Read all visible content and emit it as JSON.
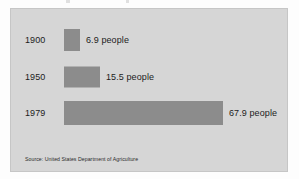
{
  "figure": {
    "panel_background": "#d6d6d6",
    "bar_color": "#8c8c8c",
    "text_color": "#1c1c1c"
  },
  "source_note": "Source: United States Department of Agriculture",
  "chart_data": {
    "type": "bar",
    "orientation": "horizontal",
    "title": "",
    "xlabel": "",
    "ylabel": "",
    "categories": [
      "1900",
      "1950",
      "1979"
    ],
    "values": [
      6.9,
      15.5,
      67.9
    ],
    "value_labels": [
      "6.9 people",
      "15.5 people",
      "67.9 people"
    ],
    "unit": "people",
    "xlim": [
      0,
      67.9
    ],
    "grid": false,
    "legend": "none",
    "series": [
      {
        "name": "People fed per farm worker",
        "values": [
          6.9,
          15.5,
          67.9
        ]
      }
    ]
  }
}
